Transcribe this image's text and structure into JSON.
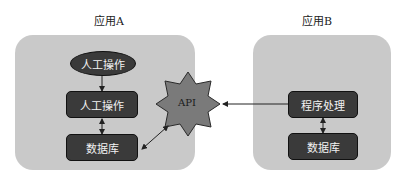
{
  "diagram": {
    "app_a": {
      "title": "应用A",
      "nodes": [
        {
          "id": "manual-op-ellipse",
          "label": "人工操作",
          "shape": "ellipse"
        },
        {
          "id": "manual-op-box",
          "label": "人工操作",
          "shape": "rounded-rect"
        },
        {
          "id": "database-a",
          "label": "数据库",
          "shape": "rounded-rect"
        }
      ]
    },
    "app_b": {
      "title": "应用B",
      "nodes": [
        {
          "id": "program-processing",
          "label": "程序处理",
          "shape": "rounded-rect"
        },
        {
          "id": "database-b",
          "label": "数据库",
          "shape": "rounded-rect"
        }
      ]
    },
    "api": {
      "label": "API",
      "shape": "8-point-star"
    },
    "edges": [
      {
        "from": "manual-op-ellipse",
        "to": "manual-op-box",
        "type": "arrow"
      },
      {
        "from": "manual-op-box",
        "to": "database-a",
        "type": "bidirectional"
      },
      {
        "from": "database-a",
        "to": "api",
        "type": "bidirectional"
      },
      {
        "from": "program-processing",
        "to": "api",
        "type": "arrow"
      },
      {
        "from": "program-processing",
        "to": "database-b",
        "type": "bidirectional"
      }
    ],
    "colors": {
      "app_box": "#c9c9c9",
      "node_fill": "#3a3a3a",
      "node_text": "#f2f2f2",
      "api_fill": "#7a7a7a"
    }
  }
}
